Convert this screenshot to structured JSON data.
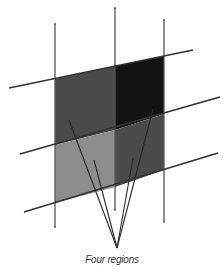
{
  "diagram": {
    "caption": "Four regions",
    "colors": {
      "background": "#ffffff",
      "line": "#333333",
      "region_top_left": "#4a4a4a",
      "region_top_right": "#131313",
      "region_bottom_left": "#8d8d8d",
      "region_bottom_right": "#4b4b4b",
      "caption": "#333333"
    },
    "vertical_lines": [
      {
        "name": "left",
        "x1": 55,
        "y1": 24,
        "x2": 55,
        "y2": 227
      },
      {
        "name": "middle",
        "x1": 115,
        "y1": 8,
        "x2": 115,
        "y2": 210
      },
      {
        "name": "right",
        "x1": 164,
        "y1": 20,
        "x2": 164,
        "y2": 222
      }
    ],
    "slanted_lines": [
      {
        "name": "top",
        "x1": 9,
        "y1": 88,
        "x2": 193,
        "y2": 50
      },
      {
        "name": "middle",
        "x1": 20,
        "y1": 154,
        "x2": 220,
        "y2": 97
      },
      {
        "name": "bottom",
        "x1": 24,
        "y1": 212,
        "x2": 218,
        "y2": 153
      }
    ],
    "regions": [
      {
        "name": "top-left",
        "points": "55,79 115,66 115,130 55,145"
      },
      {
        "name": "top-right",
        "points": "115,66 164,56 164,114 115,130"
      },
      {
        "name": "bottom-left",
        "points": "55,145 115,130 115,187 55,203"
      },
      {
        "name": "bottom-right",
        "points": "115,130 164,114 164,170 115,187"
      }
    ],
    "pointer_target": {
      "x": 117,
      "y": 248
    },
    "pointers": [
      {
        "region": "top-left",
        "x": 69,
        "y": 120
      },
      {
        "region": "bottom-left",
        "x": 94,
        "y": 160
      },
      {
        "region": "bottom-right",
        "x": 133,
        "y": 158
      },
      {
        "region": "top-right",
        "x": 153,
        "y": 109
      }
    ]
  }
}
